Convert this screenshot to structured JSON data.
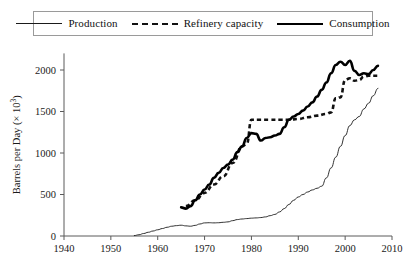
{
  "chart_data": {
    "type": "line",
    "title": "",
    "xlabel": "",
    "ylabel": "Barrels per Day (× 10³)",
    "xlim": [
      1940,
      2010
    ],
    "ylim": [
      0,
      2200
    ],
    "xticks": [
      1940,
      1950,
      1960,
      1970,
      1980,
      1990,
      2000,
      2010
    ],
    "xtick_labels": [
      "1940",
      "1950",
      "1960",
      "1970",
      "1980",
      "1990",
      "2000",
      "2010"
    ],
    "yticks": [
      0,
      500,
      1000,
      1500,
      2000
    ],
    "ytick_labels": [
      "0",
      "500",
      "1000",
      "1500",
      "2000"
    ],
    "grid": false,
    "legend_position": "top",
    "series": [
      {
        "name": "Production",
        "style": "thin-solid",
        "color": "#1a1a1a",
        "x": [
          1955,
          1956,
          1957,
          1958,
          1959,
          1960,
          1961,
          1962,
          1963,
          1964,
          1965,
          1966,
          1967,
          1968,
          1969,
          1970,
          1971,
          1972,
          1973,
          1974,
          1975,
          1976,
          1977,
          1978,
          1979,
          1980,
          1981,
          1982,
          1983,
          1984,
          1985,
          1986,
          1987,
          1988,
          1989,
          1990,
          1991,
          1992,
          1993,
          1994,
          1995,
          1996,
          1997,
          1998,
          1999,
          2000,
          2001,
          2002,
          2003,
          2004,
          2005,
          2006,
          2007
        ],
        "y": [
          5,
          15,
          30,
          45,
          60,
          75,
          90,
          105,
          118,
          125,
          130,
          122,
          118,
          128,
          145,
          158,
          160,
          158,
          160,
          165,
          170,
          185,
          198,
          205,
          210,
          215,
          218,
          222,
          230,
          245,
          260,
          290,
          330,
          380,
          430,
          470,
          500,
          530,
          555,
          575,
          600,
          700,
          820,
          950,
          1080,
          1210,
          1330,
          1400,
          1440,
          1530,
          1600,
          1690,
          1780
        ]
      },
      {
        "name": "Refinery capacity",
        "style": "thick-dashed",
        "color": "#111111",
        "x": [
          1966,
          1968,
          1970,
          1972,
          1974,
          1976,
          1978,
          1979,
          1980,
          1982,
          1984,
          1986,
          1988,
          1990,
          1992,
          1994,
          1996,
          1997,
          1998,
          1999,
          2000,
          2001,
          2002,
          2003,
          2004,
          2005,
          2006,
          2007
        ],
        "y": [
          360,
          430,
          520,
          620,
          720,
          880,
          1080,
          1110,
          1400,
          1400,
          1400,
          1400,
          1400,
          1410,
          1430,
          1450,
          1470,
          1490,
          1660,
          1670,
          1880,
          1900,
          1870,
          1880,
          1920,
          1930,
          1930,
          1930
        ]
      },
      {
        "name": "Consumption",
        "style": "thick-solid",
        "color": "#000000",
        "x": [
          1965,
          1966,
          1967,
          1968,
          1969,
          1970,
          1971,
          1972,
          1973,
          1974,
          1975,
          1976,
          1977,
          1978,
          1979,
          1980,
          1981,
          1982,
          1983,
          1984,
          1985,
          1986,
          1987,
          1988,
          1989,
          1990,
          1991,
          1992,
          1993,
          1994,
          1995,
          1996,
          1997,
          1998,
          1999,
          2000,
          2001,
          2002,
          2003,
          2004,
          2005,
          2006,
          2007
        ],
        "y": [
          345,
          330,
          360,
          430,
          500,
          560,
          620,
          700,
          760,
          820,
          860,
          920,
          1010,
          1080,
          1180,
          1240,
          1230,
          1150,
          1180,
          1190,
          1210,
          1230,
          1310,
          1400,
          1440,
          1470,
          1510,
          1560,
          1610,
          1680,
          1760,
          1850,
          1960,
          2060,
          2100,
          2060,
          2110,
          1990,
          1940,
          1960,
          1950,
          2000,
          2050
        ]
      }
    ]
  },
  "legend": {
    "items": [
      {
        "label": "Production",
        "style": "thin-solid"
      },
      {
        "label": "Refinery capacity",
        "style": "thick-dashed"
      },
      {
        "label": "Consumption",
        "style": "thick-solid"
      }
    ]
  }
}
